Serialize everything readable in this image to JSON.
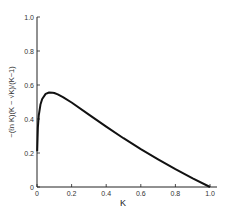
{
  "chart_data": {
    "type": "line",
    "title": "",
    "xlabel": "K",
    "ylabel": "−(ℓn K)(K − √K)/(K−1)",
    "xlim": [
      0,
      1.0
    ],
    "ylim": [
      0,
      1.0
    ],
    "grid": false,
    "legend": null,
    "x_ticks": [
      "0",
      "0.2",
      "0.4",
      "0.6",
      "0.8",
      "1.0"
    ],
    "y_ticks": [
      "0",
      "0.2",
      "0.4",
      "0.6",
      "0.8",
      "1.0"
    ],
    "series": [
      {
        "name": "−(ℓn K)(K − √K)/(K−1)",
        "x": [
          0.001,
          0.005,
          0.01,
          0.02,
          0.03,
          0.05,
          0.07,
          0.09,
          0.1,
          0.12,
          0.15,
          0.2,
          0.3,
          0.4,
          0.5,
          0.6,
          0.7,
          0.8,
          0.9,
          1.0
        ],
        "y": [
          0.21,
          0.35,
          0.42,
          0.485,
          0.518,
          0.548,
          0.556,
          0.555,
          0.553,
          0.545,
          0.529,
          0.497,
          0.426,
          0.355,
          0.287,
          0.223,
          0.163,
          0.105,
          0.051,
          0.0
        ]
      }
    ]
  }
}
